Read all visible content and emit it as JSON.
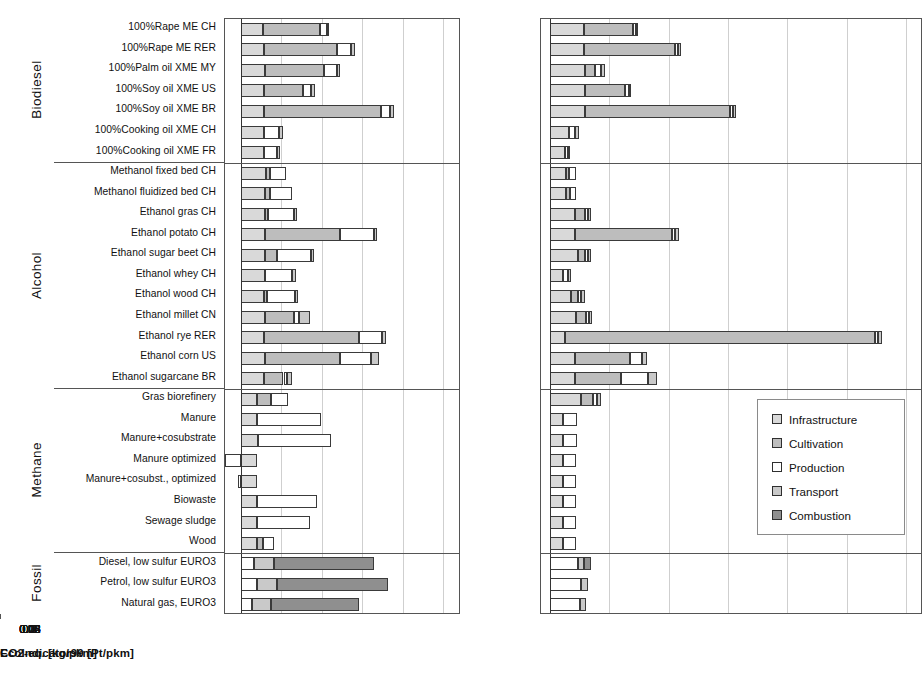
{
  "chart_data": {
    "type": "bar",
    "orientation": "horizontal",
    "stacked": true,
    "title": "",
    "panels": [
      {
        "id": "co2",
        "xlabel": "CO2-eq. [kg/pkm]",
        "xlim": [
          -0.02,
          0.27
        ],
        "ticks": [
          0,
          0.05,
          0.1,
          0.15,
          0.2,
          0.25
        ],
        "ticklabels": [
          "0",
          "0.05",
          "0.1",
          "0.15",
          "0.2",
          "0.25"
        ],
        "grid": true
      },
      {
        "id": "eco",
        "xlabel": "EcoIndicator99 [Pt/pkm]",
        "xlim": [
          -0.003,
          0.125
        ],
        "ticks": [
          0,
          0.02,
          0.04,
          0.06,
          0.08,
          0.1,
          0.12
        ],
        "ticklabels": [
          "0",
          "0.02",
          "0.04",
          "0.06",
          "0.08",
          "0.1",
          "0.12"
        ],
        "grid": true
      }
    ],
    "series": [
      {
        "name": "Infrastructure",
        "color": "#d9d9d9"
      },
      {
        "name": "Cultivation",
        "color": "#bdbdbd"
      },
      {
        "name": "Production",
        "color": "#ffffff"
      },
      {
        "name": "Transport",
        "color": "#c9c9c9"
      },
      {
        "name": "Combustion",
        "color": "#8f8f8f"
      }
    ],
    "groups": [
      {
        "name": "Biodiesel",
        "count": 7
      },
      {
        "name": "Alcohol",
        "count": 11
      },
      {
        "name": "Methane",
        "count": 8
      },
      {
        "name": "Fossil",
        "count": 3
      }
    ],
    "categories": [
      "100%Rape ME CH",
      "100%Rape ME RER",
      "100%Palm oil XME MY",
      "100%Soy oil XME US",
      "100%Soy oil XME BR",
      "100%Cooking oil XME CH",
      "100%Cooking oil XME FR",
      "Methanol fixed bed CH",
      "Methanol fluidized bed CH",
      "Ethanol gras CH",
      "Ethanol potato CH",
      "Ethanol sugar beet CH",
      "Ethanol whey CH",
      "Ethanol wood CH",
      "Ethanol millet CN",
      "Ethanol rye RER",
      "Ethanol corn US",
      "Ethanol sugarcane BR",
      "Gras biorefinery",
      "Manure",
      "Manure+cosubstrate",
      "Manure optimized",
      "Manure+cosubst., optimized",
      "Biowaste",
      "Sewage sludge",
      "Wood",
      "Diesel, low sulfur EURO3",
      "Petrol, low sulfur EURO3",
      "Natural gas, EURO3"
    ],
    "co2_values": [
      {
        "category": "100%Rape ME CH",
        "Infrastructure": 0.0275,
        "Cultivation": 0.07,
        "Production": 0.0095,
        "Transport": 0.002,
        "Combustion": 0.0
      },
      {
        "category": "100%Rape ME RER",
        "Infrastructure": 0.028,
        "Cultivation": 0.0905,
        "Production": 0.0175,
        "Transport": 0.0045,
        "Combustion": 0.0
      },
      {
        "category": "100%Palm oil XME MY",
        "Infrastructure": 0.029,
        "Cultivation": 0.074,
        "Production": 0.0155,
        "Transport": 0.0045,
        "Combustion": 0.0
      },
      {
        "category": "100%Soy oil XME US",
        "Infrastructure": 0.028,
        "Cultivation": 0.0485,
        "Production": 0.0095,
        "Transport": 0.006,
        "Combustion": 0.0
      },
      {
        "category": "100%Soy oil XME BR",
        "Infrastructure": 0.028,
        "Cultivation": 0.1455,
        "Production": 0.0115,
        "Transport": 0.004,
        "Combustion": 0.0
      },
      {
        "category": "100%Cooking oil XME CH",
        "Infrastructure": 0.0285,
        "Cultivation": 0.0,
        "Production": 0.0185,
        "Transport": 0.0045,
        "Combustion": 0.0
      },
      {
        "category": "100%Cooking oil XME FR",
        "Infrastructure": 0.028,
        "Cultivation": 0.0,
        "Production": 0.017,
        "Transport": 0.0035,
        "Combustion": 0.0
      },
      {
        "category": "Methanol fixed bed CH",
        "Infrastructure": 0.031,
        "Cultivation": 0.005,
        "Production": 0.0195,
        "Transport": 0.0,
        "Combustion": 0.0
      },
      {
        "category": "Methanol fluidized bed CH",
        "Infrastructure": 0.03,
        "Cultivation": 0.0055,
        "Production": 0.027,
        "Transport": 0.0,
        "Combustion": 0.0
      },
      {
        "category": "Ethanol gras CH",
        "Infrastructure": 0.029,
        "Cultivation": 0.0045,
        "Production": 0.032,
        "Transport": 0.0035,
        "Combustion": 0.0
      },
      {
        "category": "Ethanol potato CH",
        "Infrastructure": 0.029,
        "Cultivation": 0.093,
        "Production": 0.043,
        "Transport": 0.0035,
        "Combustion": 0.0
      },
      {
        "category": "Ethanol sugar beet CH",
        "Infrastructure": 0.029,
        "Cultivation": 0.0155,
        "Production": 0.042,
        "Transport": 0.004,
        "Combustion": 0.0
      },
      {
        "category": "Ethanol whey CH",
        "Infrastructure": 0.0295,
        "Cultivation": 0.0,
        "Production": 0.034,
        "Transport": 0.004,
        "Combustion": 0.0
      },
      {
        "category": "Ethanol wood CH",
        "Infrastructure": 0.028,
        "Cultivation": 0.0045,
        "Production": 0.0345,
        "Transport": 0.0035,
        "Combustion": 0.0
      },
      {
        "category": "Ethanol millet CN",
        "Infrastructure": 0.029,
        "Cultivation": 0.036,
        "Production": 0.0065,
        "Transport": 0.014,
        "Combustion": 0.0
      },
      {
        "category": "Ethanol rye RER",
        "Infrastructure": 0.0285,
        "Cultivation": 0.117,
        "Production": 0.029,
        "Transport": 0.0045,
        "Combustion": 0.0
      },
      {
        "category": "Ethanol corn US",
        "Infrastructure": 0.029,
        "Cultivation": 0.0935,
        "Production": 0.038,
        "Transport": 0.01,
        "Combustion": 0.0
      },
      {
        "category": "Ethanol sugarcane BR",
        "Infrastructure": 0.0285,
        "Cultivation": 0.024,
        "Production": 0.004,
        "Transport": 0.0065,
        "Combustion": 0.0
      },
      {
        "category": "Gras biorefinery",
        "Infrastructure": 0.02,
        "Cultivation": 0.0165,
        "Production": 0.022,
        "Transport": 0.0,
        "Combustion": 0.0
      },
      {
        "category": "Manure",
        "Infrastructure": 0.02,
        "Cultivation": 0.0,
        "Production": 0.079,
        "Transport": 0.0,
        "Combustion": 0.0
      },
      {
        "category": "Manure+cosubstrate",
        "Infrastructure": 0.0205,
        "Cultivation": 0.0,
        "Production": 0.091,
        "Transport": 0.0,
        "Combustion": 0.0
      },
      {
        "category": "Manure optimized",
        "Infrastructure": 0.02,
        "Cultivation": 0.0,
        "Production": -0.02,
        "Transport": 0.0,
        "Combustion": 0.0
      },
      {
        "category": "Manure+cosubst., optimized",
        "Infrastructure": 0.02,
        "Cultivation": 0.0,
        "Production": -0.0045,
        "Transport": 0.0,
        "Combustion": 0.0
      },
      {
        "category": "Biowaste",
        "Infrastructure": 0.02,
        "Cultivation": 0.0,
        "Production": 0.0745,
        "Transport": 0.0,
        "Combustion": 0.0
      },
      {
        "category": "Sewage sludge",
        "Infrastructure": 0.02,
        "Cultivation": 0.0,
        "Production": 0.065,
        "Transport": 0.0,
        "Combustion": 0.0
      },
      {
        "category": "Wood",
        "Infrastructure": 0.02,
        "Cultivation": 0.0075,
        "Production": 0.0135,
        "Transport": 0.0,
        "Combustion": 0.0
      },
      {
        "category": "Diesel, low sulfur EURO3",
        "Infrastructure": 0.0,
        "Cultivation": 0.0,
        "Production": 0.016,
        "Transport": 0.0245,
        "Combustion": 0.124
      },
      {
        "category": "Petrol, low sulfur EURO3",
        "Infrastructure": 0.0,
        "Cultivation": 0.0,
        "Production": 0.02,
        "Transport": 0.024,
        "Combustion": 0.1385
      },
      {
        "category": "Natural gas, EURO3",
        "Infrastructure": 0.0,
        "Cultivation": 0.0,
        "Production": 0.013,
        "Transport": 0.024,
        "Combustion": 0.1085
      }
    ],
    "eco_values": [
      {
        "category": "100%Rape ME CH",
        "Infrastructure": 0.0115,
        "Cultivation": 0.0165,
        "Production": 0.001,
        "Transport": 0.0008,
        "Combustion": 0.0
      },
      {
        "category": "100%Rape ME RER",
        "Infrastructure": 0.0115,
        "Cultivation": 0.0305,
        "Production": 0.001,
        "Transport": 0.0012,
        "Combustion": 0.0
      },
      {
        "category": "100%Palm oil XME MY",
        "Infrastructure": 0.0118,
        "Cultivation": 0.0035,
        "Production": 0.002,
        "Transport": 0.0012,
        "Combustion": 0.0
      },
      {
        "category": "100%Soy oil XME US",
        "Infrastructure": 0.0118,
        "Cultivation": 0.0135,
        "Production": 0.0012,
        "Transport": 0.0008,
        "Combustion": 0.0
      },
      {
        "category": "100%Soy oil XME BR",
        "Infrastructure": 0.0118,
        "Cultivation": 0.049,
        "Production": 0.001,
        "Transport": 0.001,
        "Combustion": 0.0
      },
      {
        "category": "100%Cooking oil XME CH",
        "Infrastructure": 0.0065,
        "Cultivation": 0.0,
        "Production": 0.002,
        "Transport": 0.0012,
        "Combustion": 0.0
      },
      {
        "category": "100%Cooking oil XME FR",
        "Infrastructure": 0.005,
        "Cultivation": 0.0,
        "Production": 0.001,
        "Transport": 0.0008,
        "Combustion": 0.0
      },
      {
        "category": "Methanol fixed bed CH",
        "Infrastructure": 0.0055,
        "Cultivation": 0.001,
        "Production": 0.0022,
        "Transport": 0.0,
        "Combustion": 0.0
      },
      {
        "category": "Methanol fluidized bed CH",
        "Infrastructure": 0.0055,
        "Cultivation": 0.0012,
        "Production": 0.0022,
        "Transport": 0.0,
        "Combustion": 0.0
      },
      {
        "category": "Ethanol gras CH",
        "Infrastructure": 0.0085,
        "Cultivation": 0.0032,
        "Production": 0.0012,
        "Transport": 0.001,
        "Combustion": 0.0
      },
      {
        "category": "Ethanol potato CH",
        "Infrastructure": 0.0085,
        "Cultivation": 0.0325,
        "Production": 0.0012,
        "Transport": 0.0012,
        "Combustion": 0.0
      },
      {
        "category": "Ethanol sugar beet CH",
        "Infrastructure": 0.0095,
        "Cultivation": 0.0022,
        "Production": 0.001,
        "Transport": 0.0012,
        "Combustion": 0.0
      },
      {
        "category": "Ethanol whey CH",
        "Infrastructure": 0.0045,
        "Cultivation": 0.0,
        "Production": 0.0015,
        "Transport": 0.001,
        "Combustion": 0.0
      },
      {
        "category": "Ethanol wood CH",
        "Infrastructure": 0.007,
        "Cultivation": 0.0025,
        "Production": 0.001,
        "Transport": 0.0012,
        "Combustion": 0.0
      },
      {
        "category": "Ethanol millet CN",
        "Infrastructure": 0.0088,
        "Cultivation": 0.0032,
        "Production": 0.001,
        "Transport": 0.0012,
        "Combustion": 0.0
      },
      {
        "category": "Ethanol rye RER",
        "Infrastructure": 0.005,
        "Cultivation": 0.1045,
        "Production": 0.001,
        "Transport": 0.0012,
        "Combustion": 0.0
      },
      {
        "category": "Ethanol corn US",
        "Infrastructure": 0.0085,
        "Cultivation": 0.0185,
        "Production": 0.004,
        "Transport": 0.0018,
        "Combustion": 0.0
      },
      {
        "category": "Ethanol sugarcane BR",
        "Infrastructure": 0.0085,
        "Cultivation": 0.0155,
        "Production": 0.009,
        "Transport": 0.003,
        "Combustion": 0.0
      },
      {
        "category": "Gras biorefinery",
        "Infrastructure": 0.0105,
        "Cultivation": 0.004,
        "Production": 0.0015,
        "Transport": 0.0012,
        "Combustion": 0.0
      },
      {
        "category": "Manure",
        "Infrastructure": 0.0045,
        "Cultivation": 0.0,
        "Production": 0.0045,
        "Transport": 0.0,
        "Combustion": 0.0
      },
      {
        "category": "Manure+cosubstrate",
        "Infrastructure": 0.0045,
        "Cultivation": 0.0,
        "Production": 0.0045,
        "Transport": 0.0,
        "Combustion": 0.0
      },
      {
        "category": "Manure optimized",
        "Infrastructure": 0.0045,
        "Cultivation": 0.0,
        "Production": 0.0042,
        "Transport": 0.0,
        "Combustion": 0.0
      },
      {
        "category": "Manure+cosubst., optimized",
        "Infrastructure": 0.0045,
        "Cultivation": 0.0,
        "Production": 0.0042,
        "Transport": 0.0,
        "Combustion": 0.0
      },
      {
        "category": "Biowaste",
        "Infrastructure": 0.0045,
        "Cultivation": 0.0,
        "Production": 0.0042,
        "Transport": 0.0,
        "Combustion": 0.0
      },
      {
        "category": "Sewage sludge",
        "Infrastructure": 0.0045,
        "Cultivation": 0.0,
        "Production": 0.0042,
        "Transport": 0.0,
        "Combustion": 0.0
      },
      {
        "category": "Wood",
        "Infrastructure": 0.0045,
        "Cultivation": 0.0,
        "Production": 0.0042,
        "Transport": 0.0,
        "Combustion": 0.0
      },
      {
        "category": "Diesel, low sulfur EURO3",
        "Infrastructure": 0.0,
        "Cultivation": 0.0,
        "Production": 0.0095,
        "Transport": 0.002,
        "Combustion": 0.0022
      },
      {
        "category": "Petrol, low sulfur EURO3",
        "Infrastructure": 0.0,
        "Cultivation": 0.0,
        "Production": 0.0105,
        "Transport": 0.0022,
        "Combustion": 0.0
      },
      {
        "category": "Natural gas, EURO3",
        "Infrastructure": 0.0,
        "Cultivation": 0.0,
        "Production": 0.01,
        "Transport": 0.0022,
        "Combustion": 0.0
      }
    ]
  },
  "legend": {
    "title": "",
    "items": [
      {
        "label": "Infrastructure",
        "color": "#d9d9d9"
      },
      {
        "label": "Cultivation",
        "color": "#bdbdbd"
      },
      {
        "label": "Production",
        "color": "#ffffff"
      },
      {
        "label": "Transport",
        "color": "#c9c9c9"
      },
      {
        "label": "Combustion",
        "color": "#8f8f8f"
      }
    ]
  }
}
